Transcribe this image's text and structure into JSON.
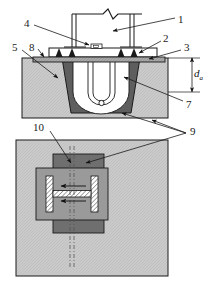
{
  "figure": {
    "type": "engineering-cross-section-and-plan",
    "views": [
      {
        "id": "elevation",
        "name": "cross-section-view"
      },
      {
        "id": "plan",
        "name": "plan-view"
      }
    ]
  },
  "callouts": [
    {
      "id": "1",
      "label": "1",
      "view": "elevation",
      "x": 178,
      "y": 14
    },
    {
      "id": "2",
      "label": "2",
      "view": "elevation",
      "x": 163,
      "y": 37
    },
    {
      "id": "3",
      "label": "3",
      "view": "elevation",
      "x": 184,
      "y": 46
    },
    {
      "id": "4",
      "label": "4",
      "view": "elevation",
      "x": 24,
      "y": 21
    },
    {
      "id": "5",
      "label": "5",
      "view": "elevation",
      "x": 13,
      "y": 45
    },
    {
      "id": "7",
      "label": "7",
      "view": "elevation",
      "x": 186,
      "y": 103
    },
    {
      "id": "8",
      "label": "8",
      "view": "elevation",
      "x": 29,
      "y": 45
    },
    {
      "id": "9",
      "label": "9",
      "view": "plan",
      "x": 191,
      "y": 131
    },
    {
      "id": "10",
      "label": "10",
      "view": "plan",
      "x": 38,
      "y": 127
    }
  ],
  "dimensions": [
    {
      "id": "da",
      "symbol": "d",
      "subscript": "a",
      "view": "elevation",
      "orientation": "vertical"
    }
  ],
  "colors": {
    "soil_fill": "#c9c9c9",
    "soil_hatch": "#b4b4b4",
    "trench_fill": "#5e5e5e",
    "plate_fill": "#8c8c8c",
    "dark_block": "#6f6f6f",
    "mid_block": "#9a9a9a",
    "tube_fill": "#ffffff",
    "outline": "#1a1a1a",
    "background": "#ffffff",
    "beam_hatch": "#d8d8d8"
  }
}
